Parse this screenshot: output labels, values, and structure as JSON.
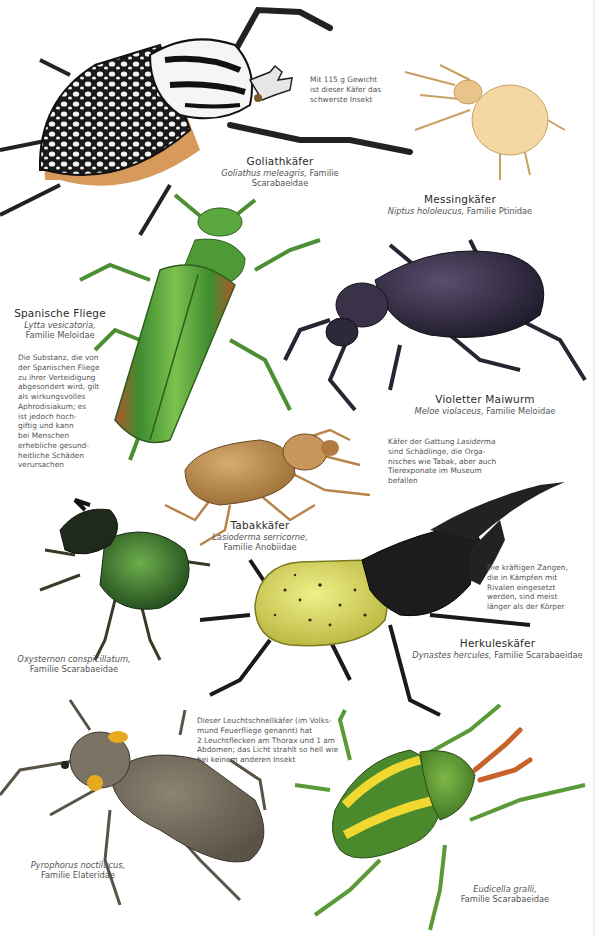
{
  "colors": {
    "background": "#ffffff",
    "label_text": "#2b2b2b",
    "caption_text": "#555555"
  },
  "beetles": [
    {
      "id": "goliath",
      "name": "Goliathkäfer",
      "species": "Goliathus meleagris,",
      "family": "Familie Scarabaeidae",
      "note": "Mit 115 g Gewicht ist dieser Käfer das schwerste Insekt",
      "note_lines": [
        "Mit 115 g Gewicht",
        "ist dieser Käfer das",
        "schwerste Insekt"
      ]
    },
    {
      "id": "messing",
      "name": "Messingkäfer",
      "species": "Niptus hololeucus,",
      "family": "Familie Ptinidae"
    },
    {
      "id": "spanish-fly",
      "name": "Spanische Fliege",
      "species": "Lytta vesicatoria,",
      "family": "Familie Meloidae",
      "note_lines": [
        "Die Substanz, die von",
        "der Spanischen Fliege",
        "zu ihrer Verteidigung",
        "abgesondert wird, gilt",
        "als wirkungsvolles",
        "Aphrodisiakum; es",
        "ist jedoch hoch-",
        "giftig und kann",
        "bei Menschen",
        "erhebliche gesund-",
        "heitliche Schäden",
        "verursachen"
      ]
    },
    {
      "id": "maiwurm",
      "name": "Violetter Maiwurm",
      "species": "Meloe violaceus,",
      "family": "Familie Meloidae"
    },
    {
      "id": "tabak",
      "name": "Tabakkäfer",
      "species": "Lasioderma serricorne,",
      "family": "Familie Anobiidae",
      "note_lines": [
        "Käfer der Gattung",
        "Lasiderma",
        "sind Schädlinge, die Orga-",
        "nisches wie Tabak, aber auch",
        "Tierexponate im Museum",
        "befallen"
      ]
    },
    {
      "id": "oxysternon",
      "species": "Oxysternon conspicillatum,",
      "family": "Familie Scarabaeidae"
    },
    {
      "id": "herkules",
      "name": "Herkuleskäfer",
      "species": "Dynastes hercules,",
      "family": "Familie Scarabaeidae",
      "note_lines": [
        "Die kräftigen Zangen,",
        "die in Kämpfen mit",
        "Rivalen eingesetzt",
        "werden, sind meist",
        "länger als der Körper"
      ]
    },
    {
      "id": "pyrophorus",
      "species": "Pyrophorus noctilucus,",
      "family": "Familie Elateridae",
      "note_lines": [
        "Dieser Leuchtschnellkäfer (im Volks-",
        "mund Feuerfliege genannt) hat",
        "2 Leuchtflecken am Thorax und 1 am",
        "Abdomen; das Licht strahlt so hell wie",
        "bei keinem anderen Insekt"
      ]
    },
    {
      "id": "eudicella",
      "species": "Eudicella gralli,",
      "family": "Familie Scarabaeidae"
    }
  ]
}
